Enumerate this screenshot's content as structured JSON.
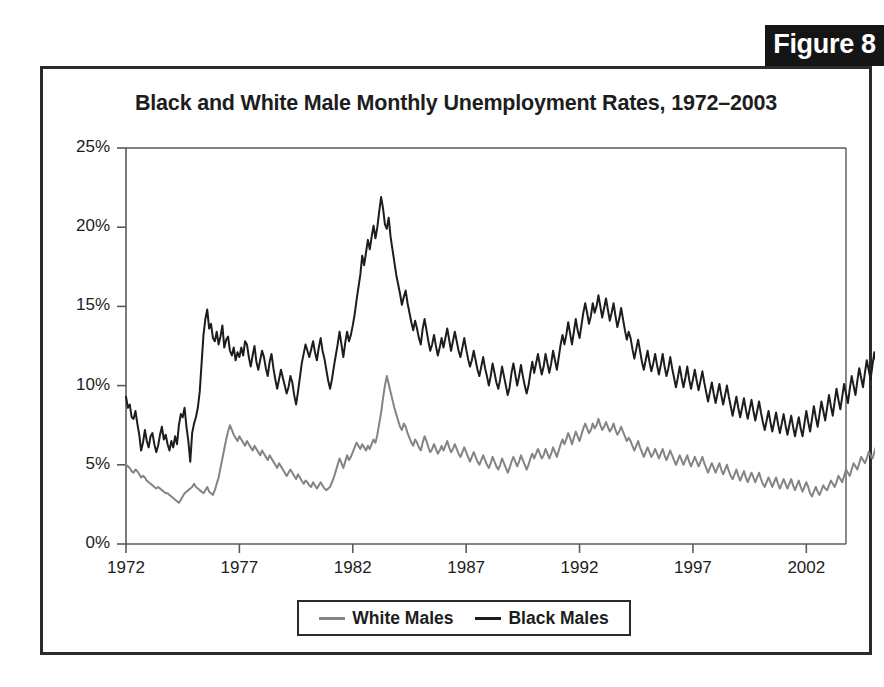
{
  "figure": {
    "badge_label": "Figure 8"
  },
  "colors": {
    "black_series": "#1d1d1d",
    "white_series": "#848484",
    "frame": "#2b2b2b",
    "axis": "#5a5a5a",
    "text": "#1d1d1d",
    "badge_background": "#151515",
    "badge_text": "#ffffff"
  },
  "legend": {
    "position": "bottom-center",
    "entries": [
      {
        "label": "White Males",
        "color": "#848484"
      },
      {
        "label": "Black Males",
        "color": "#1d1d1d"
      }
    ]
  },
  "chart_data": {
    "type": "line",
    "title": "Black and White Male Monthly Unemployment Rates, 1972–2003",
    "xlabel": "",
    "ylabel": "",
    "grid": false,
    "legend_position": "bottom-center",
    "xlim": [
      1972,
      2003.75
    ],
    "ylim": [
      0,
      25
    ],
    "ytick_labels": [
      "0%",
      "5%",
      "10%",
      "15%",
      "20%",
      "25%"
    ],
    "ytick_values": [
      0,
      5,
      10,
      15,
      20,
      25
    ],
    "xtick_labels": [
      "1972",
      "1977",
      "1982",
      "1987",
      "1992",
      "1997",
      "2002"
    ],
    "xtick_values": [
      1972,
      1977,
      1982,
      1987,
      1992,
      1997,
      2002
    ],
    "x_start": 1972,
    "x_step_months": 1,
    "series": [
      {
        "name": "Black Males",
        "color": "#1d1d1d",
        "values": [
          9.3,
          8.6,
          8.8,
          8.0,
          7.9,
          8.4,
          7.6,
          6.9,
          5.9,
          6.4,
          7.2,
          6.5,
          6.1,
          6.8,
          7.0,
          6.3,
          5.8,
          6.2,
          6.9,
          7.4,
          6.6,
          6.9,
          6.3,
          5.9,
          6.5,
          6.1,
          6.8,
          6.3,
          7.5,
          8.2,
          8.0,
          8.6,
          7.4,
          6.5,
          5.2,
          7.0,
          7.6,
          8.0,
          8.6,
          9.6,
          11.4,
          13.2,
          14.2,
          14.8,
          13.6,
          13.9,
          13.0,
          12.8,
          13.4,
          12.6,
          13.1,
          13.8,
          12.4,
          12.9,
          13.1,
          12.2,
          11.9,
          12.4,
          11.6,
          12.1,
          11.8,
          12.4,
          11.9,
          12.8,
          12.6,
          11.8,
          11.2,
          11.9,
          12.5,
          11.5,
          11.0,
          11.6,
          12.2,
          11.8,
          11.1,
          10.6,
          11.5,
          12.0,
          11.1,
          10.4,
          9.8,
          10.4,
          11.0,
          10.5,
          10.0,
          9.5,
          9.9,
          10.6,
          10.2,
          9.4,
          8.8,
          9.6,
          10.5,
          11.4,
          12.0,
          12.6,
          12.2,
          11.8,
          12.3,
          12.8,
          12.1,
          11.6,
          12.4,
          13.0,
          12.2,
          11.7,
          11.0,
          10.3,
          9.8,
          10.4,
          11.2,
          11.9,
          12.6,
          13.4,
          12.6,
          11.8,
          12.7,
          13.4,
          12.8,
          13.2,
          13.8,
          14.5,
          15.4,
          16.2,
          17.0,
          18.2,
          17.6,
          18.4,
          19.2,
          18.6,
          19.4,
          20.1,
          19.3,
          20.0,
          21.0,
          21.9,
          21.2,
          20.2,
          19.9,
          20.6,
          19.4,
          18.6,
          17.8,
          17.0,
          16.4,
          15.8,
          15.1,
          15.6,
          16.0,
          15.2,
          14.6,
          14.0,
          13.5,
          14.1,
          13.6,
          13.0,
          12.6,
          13.6,
          14.2,
          13.5,
          12.8,
          12.2,
          12.6,
          13.2,
          12.5,
          11.9,
          12.4,
          13.0,
          12.4,
          13.0,
          13.6,
          12.9,
          12.2,
          12.8,
          13.4,
          12.8,
          12.2,
          11.8,
          12.4,
          13.0,
          12.3,
          11.7,
          11.2,
          11.6,
          12.2,
          11.6,
          11.0,
          10.6,
          11.2,
          11.8,
          11.1,
          10.6,
          10.0,
          10.6,
          11.4,
          10.8,
          10.2,
          9.8,
          10.4,
          11.2,
          10.6,
          10.0,
          9.4,
          9.9,
          10.8,
          11.4,
          10.7,
          10.0,
          10.6,
          11.3,
          10.6,
          10.0,
          9.5,
          10.0,
          10.8,
          11.5,
          10.8,
          11.4,
          12.0,
          11.3,
          10.7,
          11.2,
          12.0,
          11.4,
          10.8,
          11.4,
          12.2,
          11.6,
          11.0,
          11.8,
          12.6,
          13.2,
          12.6,
          13.2,
          14.0,
          13.3,
          12.6,
          13.4,
          14.2,
          13.5,
          13.0,
          13.8,
          14.6,
          15.2,
          14.6,
          13.9,
          14.4,
          15.2,
          14.6,
          15.0,
          15.7,
          15.0,
          14.3,
          14.9,
          15.5,
          14.8,
          14.1,
          14.6,
          15.2,
          14.4,
          13.7,
          14.2,
          14.9,
          14.2,
          13.5,
          12.9,
          13.4,
          13.0,
          12.3,
          11.7,
          12.3,
          12.9,
          12.2,
          11.5,
          11.0,
          11.6,
          12.2,
          11.5,
          10.9,
          11.4,
          12.0,
          11.3,
          10.7,
          11.3,
          12.0,
          11.2,
          10.6,
          11.1,
          11.8,
          11.1,
          10.5,
          9.9,
          10.5,
          11.2,
          10.5,
          9.9,
          10.5,
          11.2,
          10.4,
          9.8,
          10.4,
          11.0,
          10.3,
          9.7,
          10.3,
          10.9,
          10.2,
          9.6,
          9.0,
          9.6,
          10.2,
          9.5,
          8.9,
          9.5,
          10.1,
          9.4,
          8.8,
          9.4,
          10.0,
          9.3,
          8.7,
          8.1,
          8.7,
          9.3,
          8.6,
          8.0,
          8.6,
          9.2,
          8.5,
          7.9,
          8.5,
          9.1,
          8.4,
          7.8,
          8.4,
          9.0,
          8.3,
          7.7,
          7.2,
          7.8,
          8.4,
          7.7,
          7.1,
          7.7,
          8.3,
          7.6,
          7.0,
          7.6,
          8.2,
          7.5,
          6.9,
          7.5,
          8.1,
          7.4,
          6.8,
          7.4,
          8.0,
          7.3,
          6.8,
          7.6,
          8.4,
          7.7,
          7.1,
          7.9,
          8.7,
          8.0,
          7.4,
          8.2,
          9.0,
          8.4,
          7.8,
          8.6,
          9.4,
          8.7,
          8.1,
          9.0,
          9.8,
          9.1,
          8.5,
          9.3,
          10.1,
          9.5,
          8.9,
          9.8,
          10.6,
          10.0,
          9.4,
          10.3,
          11.1,
          10.5,
          9.9,
          10.8,
          11.6,
          11.0,
          10.4,
          11.3,
          12.1,
          11.5,
          10.9,
          11.8,
          12.4,
          11.7,
          11.1,
          10.6
        ]
      },
      {
        "name": "White Males",
        "color": "#848484",
        "values": [
          5.0,
          4.9,
          4.8,
          4.6,
          4.5,
          4.7,
          4.6,
          4.4,
          4.2,
          4.3,
          4.2,
          4.0,
          3.9,
          3.8,
          3.7,
          3.6,
          3.5,
          3.6,
          3.5,
          3.4,
          3.3,
          3.2,
          3.2,
          3.1,
          3.0,
          2.9,
          2.8,
          2.7,
          2.6,
          2.8,
          3.0,
          3.2,
          3.3,
          3.4,
          3.5,
          3.6,
          3.8,
          3.6,
          3.5,
          3.4,
          3.3,
          3.2,
          3.4,
          3.6,
          3.3,
          3.2,
          3.1,
          3.4,
          3.8,
          4.2,
          4.8,
          5.4,
          6.0,
          6.6,
          7.1,
          7.5,
          7.2,
          6.9,
          6.7,
          6.5,
          6.8,
          6.6,
          6.4,
          6.2,
          6.5,
          6.3,
          6.1,
          5.9,
          6.2,
          6.0,
          5.8,
          5.6,
          5.9,
          5.7,
          5.5,
          5.3,
          5.6,
          5.4,
          5.2,
          5.0,
          4.8,
          5.1,
          4.9,
          4.7,
          4.5,
          4.3,
          4.5,
          4.7,
          4.5,
          4.3,
          4.1,
          4.4,
          4.2,
          4.0,
          3.8,
          4.0,
          3.9,
          3.7,
          3.6,
          3.9,
          3.7,
          3.5,
          3.7,
          3.9,
          3.7,
          3.5,
          3.4,
          3.5,
          3.6,
          3.9,
          4.2,
          4.6,
          5.0,
          5.4,
          5.1,
          4.8,
          5.2,
          5.6,
          5.3,
          5.5,
          5.8,
          6.1,
          6.4,
          6.2,
          6.0,
          6.3,
          6.1,
          5.9,
          6.2,
          6.0,
          6.3,
          6.6,
          6.4,
          6.9,
          7.6,
          8.3,
          9.2,
          10.0,
          10.6,
          10.1,
          9.6,
          9.1,
          8.6,
          8.2,
          7.8,
          7.4,
          7.2,
          7.6,
          7.4,
          7.0,
          6.7,
          6.4,
          6.2,
          6.6,
          6.4,
          6.1,
          5.9,
          6.4,
          6.8,
          6.5,
          6.1,
          5.8,
          6.0,
          6.3,
          6.0,
          5.7,
          5.9,
          6.2,
          5.9,
          6.2,
          6.5,
          6.1,
          5.8,
          6.0,
          6.3,
          6.0,
          5.7,
          5.5,
          5.8,
          6.1,
          5.8,
          5.5,
          5.2,
          5.5,
          5.8,
          5.5,
          5.2,
          5.0,
          5.3,
          5.6,
          5.3,
          5.0,
          4.8,
          5.1,
          5.5,
          5.2,
          4.9,
          4.7,
          5.0,
          5.4,
          5.1,
          4.8,
          4.5,
          4.8,
          5.2,
          5.5,
          5.2,
          4.9,
          5.2,
          5.6,
          5.3,
          5.0,
          4.7,
          5.0,
          5.4,
          5.7,
          5.4,
          5.7,
          6.0,
          5.7,
          5.4,
          5.6,
          6.0,
          5.7,
          5.4,
          5.7,
          6.1,
          5.8,
          5.5,
          5.9,
          6.3,
          6.6,
          6.3,
          6.6,
          7.0,
          6.7,
          6.3,
          6.7,
          7.1,
          6.8,
          6.5,
          6.9,
          7.3,
          7.6,
          7.3,
          7.0,
          7.2,
          7.6,
          7.3,
          7.5,
          7.9,
          7.5,
          7.2,
          7.4,
          7.7,
          7.4,
          7.1,
          7.3,
          7.6,
          7.2,
          6.9,
          7.1,
          7.4,
          7.1,
          6.8,
          6.5,
          6.7,
          6.5,
          6.2,
          5.9,
          6.2,
          6.5,
          6.1,
          5.8,
          5.5,
          5.8,
          6.1,
          5.8,
          5.5,
          5.7,
          6.0,
          5.7,
          5.4,
          5.7,
          6.0,
          5.6,
          5.3,
          5.6,
          5.9,
          5.6,
          5.3,
          5.0,
          5.3,
          5.6,
          5.3,
          5.0,
          5.3,
          5.6,
          5.2,
          4.9,
          5.2,
          5.5,
          5.2,
          4.9,
          5.2,
          5.5,
          5.1,
          4.8,
          4.5,
          4.8,
          5.1,
          4.8,
          4.5,
          4.8,
          5.1,
          4.7,
          4.4,
          4.7,
          5.0,
          4.6,
          4.3,
          4.1,
          4.4,
          4.7,
          4.3,
          4.0,
          4.3,
          4.6,
          4.2,
          3.9,
          4.2,
          4.5,
          4.2,
          3.9,
          4.2,
          4.5,
          4.1,
          3.8,
          3.6,
          3.9,
          4.2,
          3.9,
          3.6,
          3.9,
          4.2,
          3.8,
          3.5,
          3.8,
          4.1,
          3.8,
          3.5,
          3.8,
          4.1,
          3.7,
          3.4,
          3.7,
          4.0,
          3.6,
          3.3,
          3.6,
          3.9,
          3.6,
          3.2,
          3.0,
          3.3,
          3.6,
          3.3,
          3.1,
          3.4,
          3.7,
          3.5,
          3.4,
          3.7,
          4.0,
          3.8,
          3.6,
          3.9,
          4.3,
          4.1,
          3.9,
          4.3,
          4.7,
          4.5,
          4.3,
          4.7,
          5.1,
          4.9,
          4.7,
          5.1,
          5.5,
          5.3,
          5.1,
          5.4,
          5.8,
          5.6,
          5.4,
          5.8,
          6.2,
          6.0,
          5.7,
          6.0,
          6.4,
          5.9,
          5.6,
          5.3
        ]
      }
    ]
  }
}
